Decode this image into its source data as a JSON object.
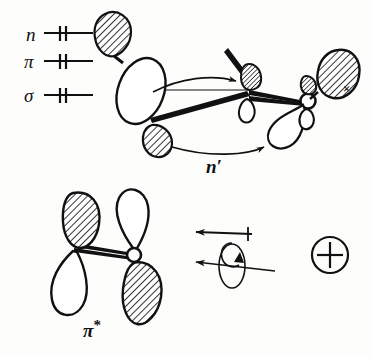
{
  "figure": {
    "type": "chemistry-orbital-diagram",
    "title": "",
    "background_color": "#fdfdfc",
    "ink_color": "#111111"
  },
  "energy_levels": {
    "caption": "",
    "items": [
      {
        "label": "n",
        "electrons": 2,
        "electron_marks": "||",
        "line_breaks": 2
      },
      {
        "label": "π",
        "electrons": 2,
        "electron_marks": "||",
        "line_breaks": 2
      },
      {
        "label": "σ",
        "electrons": 2,
        "electron_marks": "||",
        "line_breaks": 2
      }
    ]
  },
  "labels": {
    "n_prime": "n′",
    "pi_star_base": "π",
    "pi_star_sup": "*",
    "cross_mark": "×",
    "circled_plus": "⊕"
  },
  "molecule_top": {
    "atom_label": "O",
    "description": "carbonyl with hatched and open orbital lobes",
    "lobes": [
      {
        "name": "upper-left-hatched-lobe",
        "fill": "hatched"
      },
      {
        "name": "upper-left-open-ellipse",
        "fill": "open"
      },
      {
        "name": "lower-left-hatched-lobe",
        "fill": "hatched"
      },
      {
        "name": "mid-hatched-lobe",
        "fill": "hatched"
      },
      {
        "name": "mid-open-lobe",
        "fill": "open"
      },
      {
        "name": "oxygen-small-hatched-lobe",
        "fill": "hatched"
      },
      {
        "name": "oxygen-large-hatched-lobe",
        "fill": "hatched"
      },
      {
        "name": "oxygen-open-lobe-left",
        "fill": "open"
      },
      {
        "name": "oxygen-open-lobe-down",
        "fill": "open"
      }
    ],
    "transition_arrows": 2,
    "pointer_arrow": 1
  },
  "molecule_bottom": {
    "atom_label": "O",
    "description": "pi-star antibonding orbital, four lobes alternating phase",
    "lobes": [
      {
        "name": "pistar-upper-left-lobe",
        "fill": "hatched"
      },
      {
        "name": "pistar-lower-left-lobe",
        "fill": "open"
      },
      {
        "name": "pistar-upper-right-lobe",
        "fill": "open"
      },
      {
        "name": "pistar-lower-right-lobe",
        "fill": "hatched"
      }
    ]
  },
  "rotation_group": {
    "arrows": [
      {
        "name": "upper-rotation-arrow",
        "direction": "left",
        "has_tick": true
      },
      {
        "name": "lower-rotation-arrow",
        "direction": "left",
        "has_tick": false
      }
    ],
    "spin_loops": 2
  }
}
